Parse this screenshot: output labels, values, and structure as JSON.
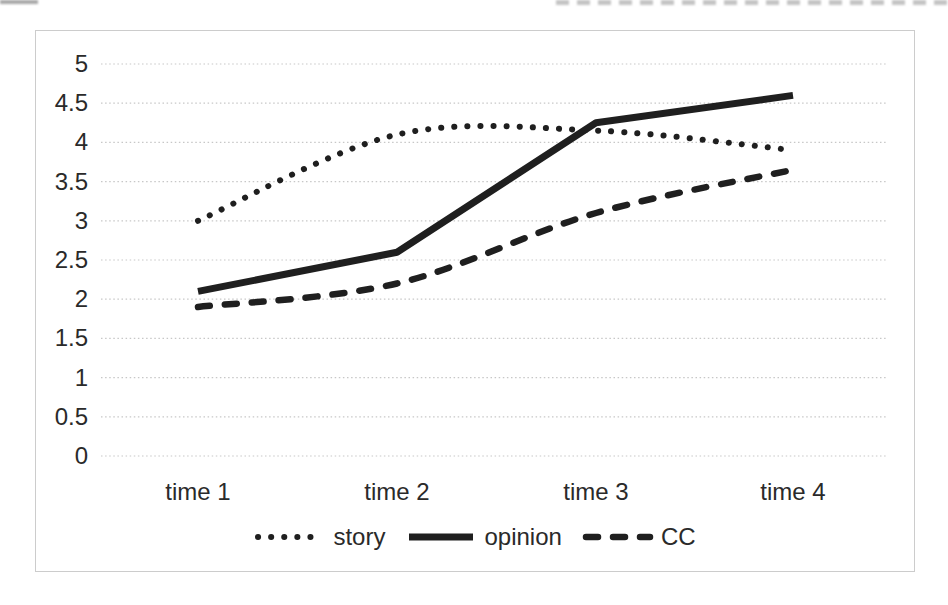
{
  "chart_data": {
    "type": "line",
    "categories": [
      "time 1",
      "time 2",
      "time 3",
      "time 4"
    ],
    "series": [
      {
        "name": "story",
        "style": "dotted",
        "smooth": true,
        "values": [
          3.0,
          4.1,
          4.15,
          3.9
        ]
      },
      {
        "name": "opinion",
        "style": "solid",
        "smooth": false,
        "values": [
          2.1,
          2.6,
          4.25,
          4.6
        ]
      },
      {
        "name": "CC",
        "style": "dashed",
        "smooth": true,
        "values": [
          1.9,
          2.2,
          3.1,
          3.65
        ]
      }
    ],
    "title": "",
    "xlabel": "",
    "ylabel": "",
    "ylim": [
      0,
      5
    ],
    "ytick_step": 0.5,
    "yticks": [
      "0",
      "0.5",
      "1",
      "1.5",
      "2",
      "2.5",
      "3",
      "3.5",
      "4",
      "4.5",
      "5"
    ],
    "grid": true,
    "legend_position": "bottom",
    "colors": {
      "line": "#1f1f1f",
      "grid": "#c7c7c7",
      "frame_border": "#cccccc",
      "text": "#2a2a2a"
    }
  }
}
